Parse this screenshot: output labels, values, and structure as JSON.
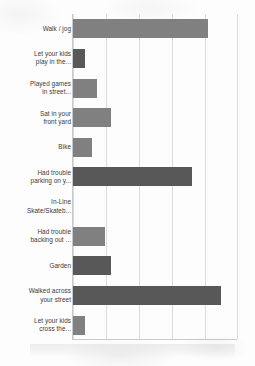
{
  "chart_data": {
    "type": "bar",
    "orientation": "horizontal",
    "title": "",
    "subtitle": "",
    "xlabel": "",
    "ylabel": "",
    "xlim": [
      0,
      5
    ],
    "grid": true,
    "gridlines": [
      0,
      1,
      2,
      3,
      4,
      5
    ],
    "legend": "none",
    "categories": [
      "Walk / jog",
      "Let your kids play in the...",
      "Played games in street...",
      "Sat in your front yard",
      "Bike",
      "Had trouble parking on y...",
      "In-Line Skate/Skateb...",
      "Had trouble backing out ...",
      "Garden",
      "Walked across your street",
      "Let your kids cross the..."
    ],
    "values": [
      4.09,
      0.36,
      0.73,
      1.15,
      0.58,
      3.61,
      0.0,
      0.97,
      1.15,
      4.48,
      0.36
    ],
    "bar_colors": [
      "#808080",
      "#585858",
      "#808080",
      "#808080",
      "#808080",
      "#585858",
      "#808080",
      "#808080",
      "#585858",
      "#585858",
      "#808080"
    ]
  },
  "chart": {
    "categories": [
      {
        "label_line1": "Walk / jog",
        "label_line2": ""
      },
      {
        "label_line1": "Let your kids",
        "label_line2": "play in the..."
      },
      {
        "label_line1": "Played games",
        "label_line2": "in street..."
      },
      {
        "label_line1": "Sat in your",
        "label_line2": "front yard"
      },
      {
        "label_line1": "Bike",
        "label_line2": ""
      },
      {
        "label_line1": "Had trouble",
        "label_line2": "parking on y..."
      },
      {
        "label_line1": "In-Line",
        "label_line2": "Skate/Skateb..."
      },
      {
        "label_line1": "Had trouble",
        "label_line2": "backing out ..."
      },
      {
        "label_line1": "Garden",
        "label_line2": ""
      },
      {
        "label_line1": "Walked across",
        "label_line2": "your street"
      },
      {
        "label_line1": "Let your kids",
        "label_line2": "cross the..."
      }
    ]
  },
  "colors": {
    "bar_light": "#808080",
    "bar_dark": "#585858",
    "gridline": "#dcdcdc",
    "axis": "#c9c9c9",
    "label_text": "#3b3b3b",
    "background": "#fdfdfd"
  }
}
